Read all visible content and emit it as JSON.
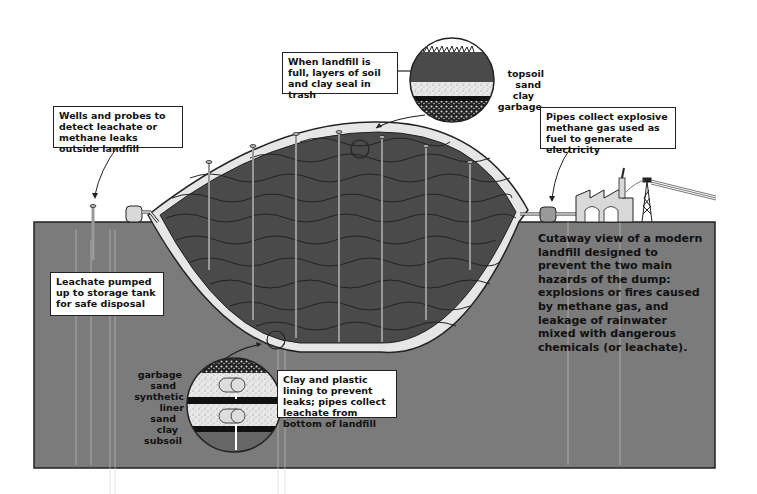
{
  "colors": {
    "ground": "#7b7b7b",
    "garbage": "#4a4a4a",
    "liner_light": "#e6e6e6",
    "outline": "#222222",
    "building": "#d9d9d9",
    "background": "#ffffff"
  },
  "callouts": {
    "top_cap": "When landfill is full, layers of soil and clay seal in trash",
    "wells": "Wells and probes to detect leachate or methane leaks outside landfill",
    "pipes_methane": "Pipes collect explosive methane gas used as fuel to generate electricity",
    "leachate_pump": "Leachate pumped up to storage tank for safe disposal",
    "bottom_lining": "Clay and plastic lining to prevent leaks; pipes collect leachate from bottom of landfill"
  },
  "top_cap_layers": [
    "topsoil",
    "sand",
    "clay",
    "garbage"
  ],
  "bottom_liner_layers": [
    "garbage",
    "sand",
    "synthetic liner",
    "sand",
    "clay",
    "subsoil"
  ],
  "caption": "Cutaway view of a modern landfill designed to prevent the two main hazards of the dump: explosions or fires caused by methane gas, and leakage of rainwater mixed with dangerous chemicals (or leachate)."
}
